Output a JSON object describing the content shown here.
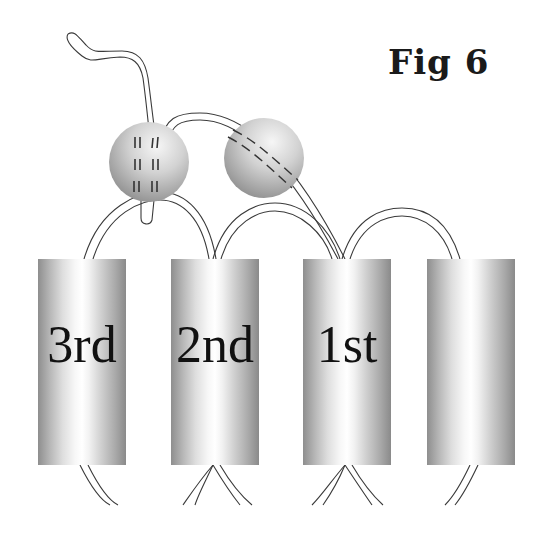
{
  "figure": {
    "title": "Fig 6",
    "helices": [
      {
        "label": "3rd"
      },
      {
        "label": "2nd"
      },
      {
        "label": "1st"
      },
      {
        "label": ""
      }
    ],
    "spheres": [
      {
        "name": "sphere-left",
        "mark_style": "vertical-dash-pairs"
      },
      {
        "name": "sphere-right",
        "mark_style": "diagonal-dashed-strand"
      }
    ],
    "colors": {
      "background": "#ffffff",
      "line": "#3a3a3a",
      "helix_dark": "#8a8a8a",
      "helix_light": "#ffffff",
      "sphere_light": "#f4f4f4",
      "sphere_dark": "#8f8f8f"
    }
  }
}
